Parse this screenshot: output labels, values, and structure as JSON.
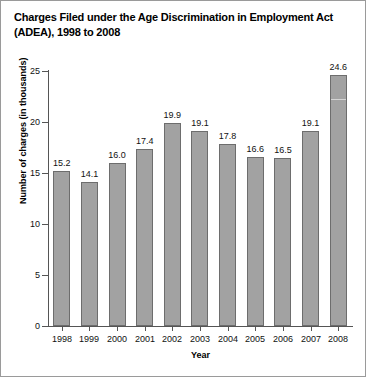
{
  "chart_data": {
    "type": "bar",
    "title": "Charges Filed under the Age Discrimination in Employment Act (ADEA), 1998 to 2008",
    "xlabel": "Year",
    "ylabel": "Number of charges (in thousands)",
    "categories": [
      "1998",
      "1999",
      "2000",
      "2001",
      "2002",
      "2003",
      "2004",
      "2005",
      "2006",
      "2007",
      "2008"
    ],
    "values": [
      15.2,
      14.1,
      16.0,
      17.4,
      19.9,
      19.1,
      17.8,
      16.6,
      16.5,
      19.1,
      24.6
    ],
    "value_labels": [
      "15.2",
      "14.1",
      "16.0",
      "17.4",
      "19.9",
      "19.1",
      "17.8",
      "16.6",
      "16.5",
      "19.1",
      "24.6"
    ],
    "ylim": [
      0,
      25
    ],
    "yticks": [
      0,
      5,
      10,
      15,
      20,
      25
    ],
    "ytick_labels": [
      "0",
      "5",
      "10",
      "15",
      "20",
      "25"
    ],
    "grid": false,
    "legend": null,
    "bar_color": "#a2a2a2",
    "bar_border_color": "#6d6d6d",
    "axis_color": "#555555",
    "text_color": "#000000"
  }
}
